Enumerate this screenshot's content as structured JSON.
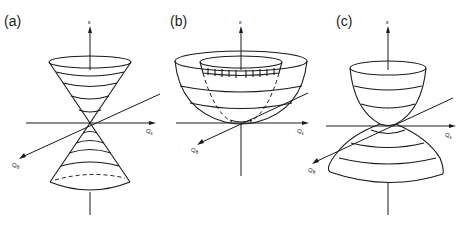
{
  "figure": {
    "panels": [
      {
        "id": "a",
        "label": "(a)",
        "shape": "double cone (Dirac cone)",
        "axes": {
          "vertical": "ε",
          "horizontal": "Q",
          "horizontal_sub": "ε",
          "diagonal": "Q",
          "diagonal_sub": "θ"
        }
      },
      {
        "id": "b",
        "label": "(b)",
        "shape": "paraboloid bowl with inner hatched cylinder",
        "axes": {
          "vertical": "ε",
          "horizontal": "Q",
          "horizontal_sub": "ε",
          "diagonal": "Q",
          "diagonal_sub": "θ"
        }
      },
      {
        "id": "c",
        "label": "(c)",
        "shape": "upper paraboloid touching inverted lower paraboloid",
        "axes": {
          "vertical": "ε",
          "horizontal": "Q",
          "horizontal_sub": "ε",
          "diagonal": "Q",
          "diagonal_sub": "θ"
        }
      }
    ],
    "colors": {
      "line": "#1a1a1a",
      "background": "#ffffff"
    }
  }
}
